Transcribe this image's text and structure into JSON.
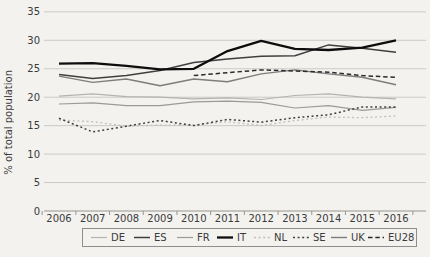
{
  "chart_data": {
    "type": "line",
    "title": "",
    "xlabel": "",
    "ylabel": "% of total population",
    "x": [
      2006,
      2007,
      2008,
      2009,
      2010,
      2011,
      2012,
      2013,
      2014,
      2015,
      2016
    ],
    "yticks": [
      0,
      5,
      10,
      15,
      20,
      25,
      30,
      35
    ],
    "ylim": [
      0,
      35
    ],
    "grid": true,
    "legend_position": "bottom",
    "grid_color": "#cbcac6",
    "axis_color": "#97968f",
    "text_color": "#3b3b3b",
    "legend_border_color": "#8f8e8a",
    "series": [
      {
        "name": "DE",
        "color": "#b3b3b3",
        "style": "solid",
        "width": 1.2,
        "values": [
          20.2,
          20.6,
          20.1,
          20.0,
          19.7,
          19.9,
          19.6,
          20.3,
          20.6,
          20.0,
          19.7
        ]
      },
      {
        "name": "ES",
        "color": "#3f3f3f",
        "style": "solid",
        "width": 1.5,
        "values": [
          24.0,
          23.3,
          23.8,
          24.7,
          26.1,
          26.7,
          27.2,
          27.3,
          29.2,
          28.6,
          27.9
        ]
      },
      {
        "name": "FR",
        "color": "#9a9a9a",
        "style": "solid",
        "width": 1.2,
        "values": [
          18.8,
          19.0,
          18.5,
          18.5,
          19.2,
          19.3,
          19.1,
          18.1,
          18.5,
          17.7,
          18.2
        ]
      },
      {
        "name": "IT",
        "color": "#0d0d0d",
        "style": "solid",
        "width": 2.3,
        "values": [
          25.9,
          26.0,
          25.5,
          24.9,
          25.0,
          28.1,
          29.9,
          28.5,
          28.3,
          28.7,
          30.0
        ]
      },
      {
        "name": "NL",
        "color": "#bfbfbf",
        "style": "dotted",
        "width": 1.3,
        "values": [
          16.0,
          15.7,
          14.9,
          15.1,
          15.1,
          15.7,
          15.0,
          15.9,
          16.5,
          16.4,
          16.7
        ]
      },
      {
        "name": "SE",
        "color": "#3f3f3f",
        "style": "dotted",
        "width": 1.5,
        "values": [
          16.3,
          13.9,
          14.9,
          15.9,
          15.0,
          16.1,
          15.6,
          16.4,
          16.9,
          18.3,
          18.3
        ]
      },
      {
        "name": "UK",
        "color": "#7d7d7d",
        "style": "solid",
        "width": 1.4,
        "values": [
          23.7,
          22.6,
          23.2,
          22.0,
          23.2,
          22.7,
          24.1,
          24.8,
          24.1,
          23.5,
          22.2
        ]
      },
      {
        "name": "EU28",
        "color": "#2b2b2b",
        "style": "dashed",
        "width": 1.5,
        "values": [
          null,
          null,
          null,
          null,
          23.8,
          24.3,
          24.8,
          24.6,
          24.4,
          23.8,
          23.5
        ]
      }
    ]
  }
}
